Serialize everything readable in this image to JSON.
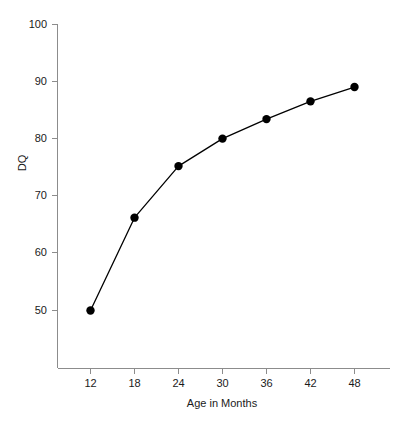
{
  "chart_data": {
    "type": "line",
    "title": "",
    "xlabel": "Age in Months",
    "ylabel": "DQ",
    "x": [
      12,
      18,
      24,
      30,
      36,
      42,
      48
    ],
    "values": [
      50,
      66.2,
      75.2,
      80,
      83.4,
      86.5,
      89
    ],
    "series": [
      {
        "name": "DQ",
        "values": [
          50,
          66.2,
          75.2,
          80,
          83.4,
          86.5,
          89
        ]
      }
    ],
    "xlim": [
      9,
      51
    ],
    "ylim": [
      44,
      100
    ],
    "x_ticks": [
      12,
      18,
      24,
      30,
      36,
      42,
      48
    ],
    "x_tick_labels": [
      "12",
      "18",
      "24",
      "30",
      "36",
      "42",
      "48"
    ],
    "y_ticks": [
      50,
      60,
      70,
      80,
      90,
      100
    ],
    "y_tick_labels": [
      "50",
      "60",
      "70",
      "80",
      "90",
      "100"
    ],
    "grid": false,
    "legend": false,
    "legend_position": "none",
    "marker": "filled-circle",
    "marker_color": "#000000",
    "line_color": "#000000",
    "axis_color": "#8c8c8c",
    "background_color": "#ffffff"
  },
  "labels": {
    "y_axis_title": "DQ",
    "x_axis_title": "Age in Months",
    "y_tick_100": "100",
    "y_tick_90": "90",
    "y_tick_80": "80",
    "y_tick_70": "70",
    "y_tick_60": "60",
    "y_tick_50": "50",
    "x_tick_12": "12",
    "x_tick_18": "18",
    "x_tick_24": "24",
    "x_tick_30": "30",
    "x_tick_36": "36",
    "x_tick_42": "42",
    "x_tick_48": "48"
  }
}
